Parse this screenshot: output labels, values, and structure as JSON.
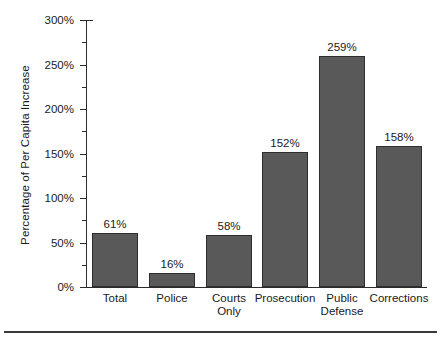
{
  "chart_data": {
    "type": "bar",
    "title": "",
    "subtitle": "",
    "xlabel": "",
    "ylabel": "Percentage of Per Capita Increase",
    "categories": [
      "Total",
      "Police",
      "Courts Only",
      "Prosecution",
      "Public Defense",
      "Corrections"
    ],
    "category_lines": [
      [
        "Total"
      ],
      [
        "Police"
      ],
      [
        "Courts",
        "Only"
      ],
      [
        "Prosecution"
      ],
      [
        "Public",
        "Defense"
      ],
      [
        "Corrections"
      ]
    ],
    "values": [
      61,
      16,
      58,
      152,
      259,
      158
    ],
    "value_labels": [
      "61%",
      "16%",
      "58%",
      "152%",
      "259%",
      "158%"
    ],
    "ylim": [
      0,
      300
    ],
    "ytick_values": [
      0,
      50,
      100,
      150,
      200,
      250,
      300
    ],
    "ytick_labels": [
      "0%",
      "50%",
      "100%",
      "150%",
      "200%",
      "250%",
      "300%"
    ],
    "yminor_tick_values": [
      25,
      75,
      125,
      175,
      225,
      275
    ],
    "grid": false,
    "legend": null,
    "legend_position": "none",
    "bar_color": "#595959",
    "bar_edge_color": "#2e2e2e",
    "axis_color": "#2b2b2b",
    "background_color": "#ffffff"
  },
  "footer": {
    "rule_color": "#3a3a3a"
  }
}
